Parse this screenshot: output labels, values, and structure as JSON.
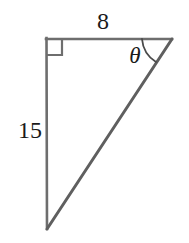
{
  "figure": {
    "kind": "right-triangle-geometry-diagram",
    "background_color": "#ffffff",
    "stroke_color": "#6e6e6e",
    "hypotenuse_stroke_color": "#5f5f5f",
    "label_color": "#1a1a1a",
    "labels": {
      "top_side": "8",
      "left_side": "15",
      "angle": "θ"
    },
    "vertices": {
      "top_left": {
        "x": 46,
        "y": 39
      },
      "top_right": {
        "x": 172,
        "y": 39
      },
      "bottom_left": {
        "x": 47,
        "y": 229
      }
    },
    "markers": {
      "right_angle_square_size": 16,
      "right_angle_at": "top_left",
      "angle_arc_radius": 30,
      "angle_arc_at": "top_right"
    }
  }
}
